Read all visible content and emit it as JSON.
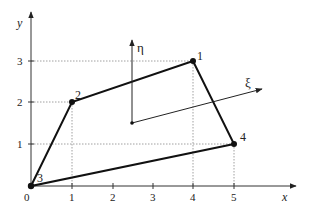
{
  "diagram": {
    "title": "",
    "axes": {
      "x_label": "x",
      "y_label": "y",
      "x_ticks": [
        "0",
        "1",
        "2",
        "3",
        "4",
        "5"
      ],
      "y_ticks": [
        "1",
        "2",
        "3"
      ]
    },
    "local_axes": {
      "xi_label": "ξ",
      "eta_label": "η",
      "origin": [
        2.5,
        1.5
      ]
    },
    "nodes": [
      {
        "id": "1",
        "label": "1",
        "x": 4,
        "y": 3
      },
      {
        "id": "2",
        "label": "2",
        "x": 1,
        "y": 2
      },
      {
        "id": "3",
        "label": "3",
        "x": 0,
        "y": 0
      },
      {
        "id": "4",
        "label": "4",
        "x": 5,
        "y": 1
      }
    ],
    "edges": [
      [
        "3",
        "2"
      ],
      [
        "2",
        "1"
      ],
      [
        "1",
        "4"
      ],
      [
        "4",
        "3"
      ]
    ],
    "colors": {
      "line": "#111111",
      "grid_dotted": "#888888",
      "axis": "#333333"
    }
  }
}
